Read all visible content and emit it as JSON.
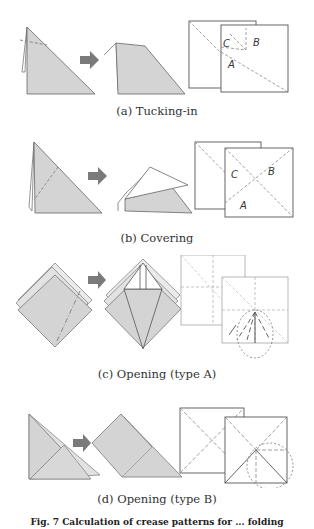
{
  "figure": {
    "panels": [
      {
        "id": "a",
        "caption": "(a) Tucking-in",
        "labels": [
          "C",
          "B",
          "A"
        ]
      },
      {
        "id": "b",
        "caption": "(b) Covering",
        "labels": [
          "C",
          "B",
          "A"
        ]
      },
      {
        "id": "c",
        "caption": "(c) Opening (type A)",
        "labels": []
      },
      {
        "id": "d",
        "caption": "(d) Opening (type B)",
        "labels": []
      }
    ],
    "figure_caption": "Fig. 7 Calculation of crease patterns for ... folding"
  },
  "colors": {
    "paper_fill": "#d4d4d4",
    "line": "#555555",
    "arrow": "#7a7a7a",
    "dashed": "#888888"
  }
}
